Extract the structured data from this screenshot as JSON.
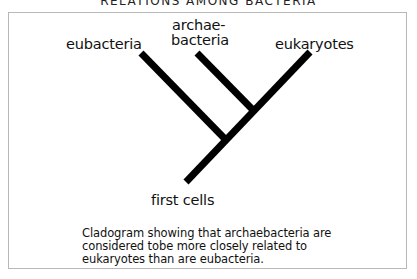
{
  "title": "RELATIONS AMONG BACTERIA",
  "diagram": {
    "type": "cladogram",
    "leaves": [
      {
        "id": "eubacteria",
        "label": "eubacteria"
      },
      {
        "id": "archaebacteria",
        "label_line1": "archae-",
        "label_line2": "bacteria"
      },
      {
        "id": "eukaryotes",
        "label": "eukaryotes"
      }
    ],
    "root": {
      "label": "first cells"
    },
    "branches": [
      {
        "from": "first cells",
        "to": "node-1"
      },
      {
        "from": "node-1",
        "to": "eubacteria"
      },
      {
        "from": "node-1",
        "to": "node-2"
      },
      {
        "from": "node-2",
        "to": "archaebacteria"
      },
      {
        "from": "node-2",
        "to": "eukaryotes"
      }
    ],
    "line_color": "#000000"
  },
  "caption": {
    "lines": [
      "Cladogram showing that archaebacteria are",
      "considered tobe more closely related to",
      "eukaryotes than are eubacteria."
    ]
  }
}
